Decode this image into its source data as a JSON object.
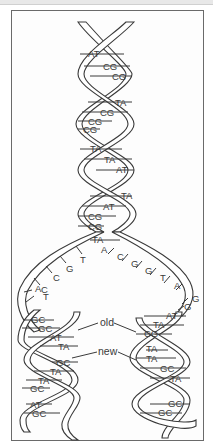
{
  "diagram": {
    "labels": {
      "old": "old",
      "new": "new"
    },
    "parent_helix": {
      "base_pairs": [
        "AT",
        "CG",
        "CG",
        "TA",
        "CG",
        "CG",
        "CG",
        "TA",
        "TA",
        "AT",
        "TA",
        "AT",
        "CG",
        "CG",
        "TA"
      ]
    },
    "fork": {
      "left_strand_bases": [
        "T",
        "G",
        "C",
        "C",
        "A",
        "T"
      ],
      "right_strand_bases": [
        "A",
        "C",
        "G",
        "G",
        "T",
        "A",
        "G",
        "G"
      ]
    },
    "left_daughter_helix": {
      "base_pairs": [
        "GC",
        "GC",
        "AT",
        "TA",
        "GC",
        "TA",
        "TA",
        "GC",
        "AT",
        "GC"
      ]
    },
    "right_daughter_helix": {
      "base_pairs": [
        "AT",
        "TA",
        "CG",
        "TA",
        "TA",
        "GC",
        "TA",
        "GC",
        "GC"
      ]
    },
    "colors": {
      "stroke": "#3a3a3a",
      "background": "#ffffff",
      "frame": "#6a6a6a"
    }
  }
}
